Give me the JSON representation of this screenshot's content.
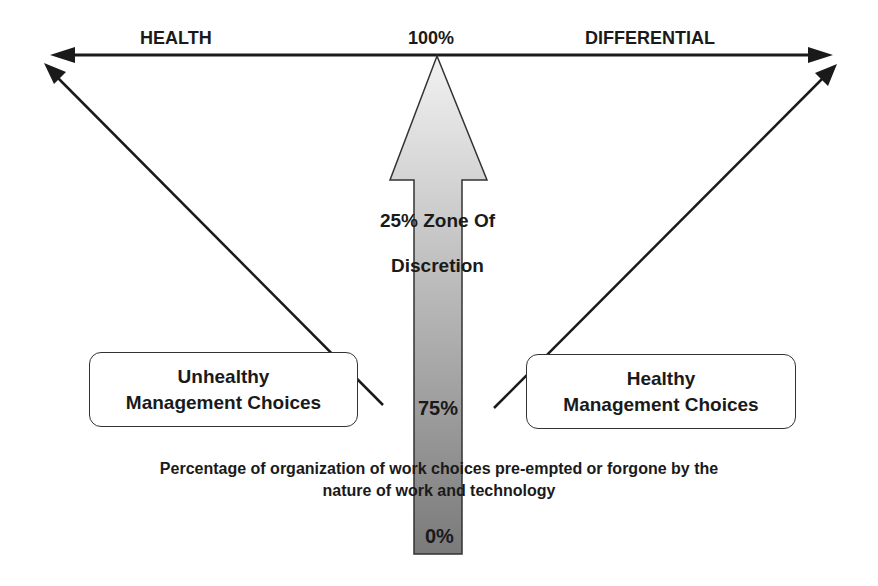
{
  "top_axis": {
    "left_label": "HEALTH",
    "center_label": "100%",
    "right_label": "DIFFERENTIAL"
  },
  "central_arrow": {
    "zone_label_line1": "25% Zone Of",
    "zone_label_line2": "Discretion",
    "mid_label": "75%",
    "bottom_label": "0%",
    "gradient_top_color": "#f2f2f2",
    "gradient_bottom_color": "#7a7a7a"
  },
  "left_box": {
    "line1": "Unhealthy",
    "line2": "Management Choices"
  },
  "right_box": {
    "line1": "Healthy",
    "line2": "Management Choices"
  },
  "caption": {
    "line1": "Percentage of organization of work choices pre-empted or forgone by the",
    "line2": "nature of work and technology"
  }
}
